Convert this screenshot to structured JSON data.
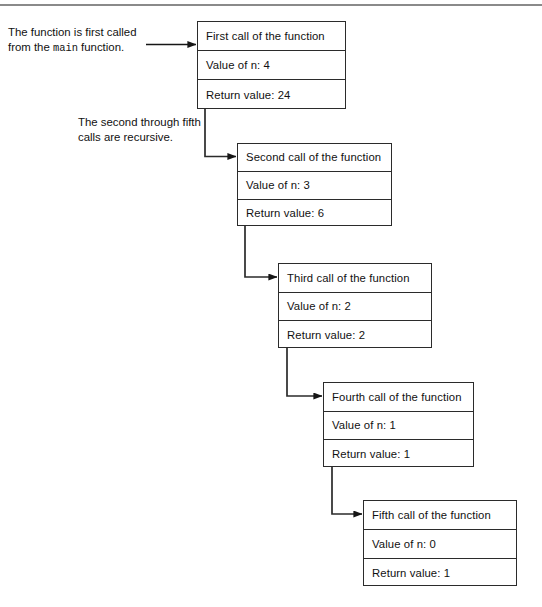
{
  "diagram": {
    "stroke_color": "#2b2b2b",
    "rule_color": "#8a8a8a",
    "background": "#ffffff",
    "annotations": [
      {
        "id": "caption1",
        "line1": "The function is first called",
        "line2_pre": "from the ",
        "line2_code": "main",
        "line2_post": " function."
      },
      {
        "id": "caption2",
        "line1": "The second through fifth",
        "line2": "calls are recursive."
      }
    ],
    "frames": [
      {
        "id": "box1",
        "header": "First call of the function",
        "value_label": "Value of n: 4",
        "return_label": "Return value: 24"
      },
      {
        "id": "box2",
        "header": "Second call of the function",
        "value_label": "Value of n: 3",
        "return_label": "Return value: 6"
      },
      {
        "id": "box3",
        "header": "Third call of the function",
        "value_label": "Value of n: 2",
        "return_label": "Return value: 2"
      },
      {
        "id": "box4",
        "header": "Fourth call of the function",
        "value_label": "Value of n: 1",
        "return_label": "Return value: 1"
      },
      {
        "id": "box5",
        "header": "Fifth call of the function",
        "value_label": "Value of n: 0",
        "return_label": "Return value: 1"
      }
    ]
  }
}
